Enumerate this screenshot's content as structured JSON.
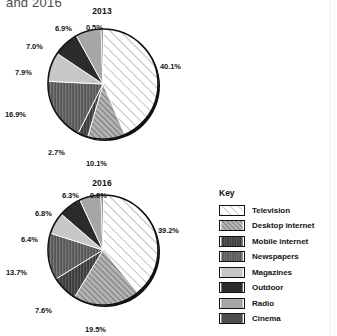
{
  "figure": {
    "title_fragment": "and 2016",
    "legend_title": "Key"
  },
  "legend": {
    "items": [
      {
        "label": "Television",
        "pattern": "diagonal-hatch-light",
        "fill": "#ffffff",
        "stroke": "#111111"
      },
      {
        "label": "Desktop internet",
        "pattern": "diagonal-hatch-dark",
        "fill": "#9a9a9a",
        "stroke": "#111111"
      },
      {
        "label": "Mobile internet",
        "pattern": "dense-dark",
        "fill": "#3f3f3f",
        "stroke": "#111111"
      },
      {
        "label": "Newspapers",
        "pattern": "vertical-dark",
        "fill": "#5c5c5c",
        "stroke": "#111111"
      },
      {
        "label": "Magazines",
        "pattern": "solid-light",
        "fill": "#c9c9c9",
        "stroke": "#111111"
      },
      {
        "label": "Outdoor",
        "pattern": "solid-very-dark",
        "fill": "#2a2a2a",
        "stroke": "#111111"
      },
      {
        "label": "Radio",
        "pattern": "solid-medium",
        "fill": "#a8a8a8",
        "stroke": "#111111"
      },
      {
        "label": "Cinema",
        "pattern": "solid-dark",
        "fill": "#4a4a4a",
        "stroke": "#111111"
      }
    ]
  },
  "chart_data": [
    {
      "type": "pie",
      "title": "2013",
      "categories": [
        "Television",
        "Desktop internet",
        "Mobile internet",
        "Newspapers",
        "Magazines",
        "Outdoor",
        "Radio",
        "Cinema"
      ],
      "values": [
        40.1,
        10.1,
        2.7,
        16.9,
        7.9,
        7.0,
        6.9,
        0.5
      ],
      "labels": [
        "40.1%",
        "10.1%",
        "2.7%",
        "16.9%",
        "7.9%",
        "7.0%",
        "6.9%",
        "0.5%"
      ],
      "unit": "%",
      "start_angle": 0,
      "direction": "clockwise",
      "legend_position": "right",
      "grid": false
    },
    {
      "type": "pie",
      "title": "2016",
      "categories": [
        "Television",
        "Desktop internet",
        "Mobile internet",
        "Newspapers",
        "Magazines",
        "Outdoor",
        "Radio",
        "Cinema"
      ],
      "values": [
        39.2,
        19.5,
        7.6,
        13.7,
        6.4,
        6.8,
        6.3,
        0.6
      ],
      "labels": [
        "39.2%",
        "19.5%",
        "7.6%",
        "13.7%",
        "6.4%",
        "6.8%",
        "6.3%",
        "0.6%"
      ],
      "unit": "%",
      "start_angle": 0,
      "direction": "clockwise",
      "legend_position": "right",
      "grid": false
    }
  ],
  "label_positions": {
    "chart0": [
      {
        "text": "40.1%",
        "left": 160,
        "top": 56
      },
      {
        "text": "10.1%",
        "left": 86,
        "top": 153
      },
      {
        "text": "2.7%",
        "left": 48,
        "top": 142
      },
      {
        "text": "16.9%",
        "left": 5,
        "top": 104
      },
      {
        "text": "7.9%",
        "left": 15,
        "top": 62
      },
      {
        "text": "7.0%",
        "left": 26,
        "top": 36
      },
      {
        "text": "6.9%",
        "left": 55,
        "top": 18
      },
      {
        "text": "0.5%",
        "left": 86,
        "top": 17
      }
    ],
    "chart1": [
      {
        "text": "39.2%",
        "left": 158,
        "top": 48
      },
      {
        "text": "19.5%",
        "left": 85,
        "top": 147
      },
      {
        "text": "7.6%",
        "left": 35,
        "top": 128
      },
      {
        "text": "13.7%",
        "left": 6,
        "top": 90
      },
      {
        "text": "6.4%",
        "left": 21,
        "top": 57
      },
      {
        "text": "6.8%",
        "left": 35,
        "top": 31
      },
      {
        "text": "6.3%",
        "left": 62,
        "top": 13
      },
      {
        "text": "0.6%",
        "left": 90,
        "top": 13
      }
    ]
  }
}
